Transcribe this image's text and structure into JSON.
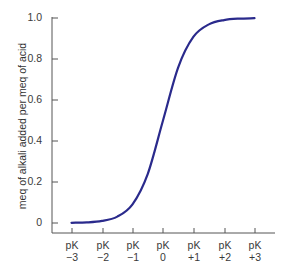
{
  "chart_data": {
    "type": "line",
    "title": "",
    "xlabel": "",
    "ylabel": "meq of alkali added per meq of acid",
    "ylim": [
      0,
      1.0
    ],
    "xlim": [
      -3,
      3
    ],
    "grid": false,
    "legend": null,
    "x_tick_labels": [
      {
        "top": "pK",
        "bottom": "−3"
      },
      {
        "top": "pK",
        "bottom": "−2"
      },
      {
        "top": "pK",
        "bottom": "−1"
      },
      {
        "top": "pK",
        "bottom": "0"
      },
      {
        "top": "pK",
        "bottom": "+1"
      },
      {
        "top": "pK",
        "bottom": "+2"
      },
      {
        "top": "pK",
        "bottom": "+3"
      }
    ],
    "y_tick_labels": [
      "0",
      "0.2",
      "0.4",
      "0.6",
      "0.8",
      "1.0"
    ],
    "series": [
      {
        "name": "titration curve",
        "color": "#2a2a8c",
        "x": [
          -3,
          -2.5,
          -2,
          -1.5,
          -1,
          -0.5,
          0,
          0.5,
          1,
          1.5,
          2,
          2.5,
          3
        ],
        "values": [
          0.001,
          0.003,
          0.01,
          0.031,
          0.091,
          0.24,
          0.5,
          0.76,
          0.909,
          0.969,
          0.99,
          0.997,
          0.999
        ]
      }
    ]
  },
  "labels": {
    "ylabel": "meq of alkali added per meq of acid",
    "yticks": [
      "0",
      "0.2",
      "0.4",
      "0.6",
      "0.8",
      "1.0"
    ],
    "xticks_top": [
      "pK",
      "pK",
      "pK",
      "pK",
      "pK",
      "pK",
      "pK"
    ],
    "xticks_bottom": [
      "−3",
      "−2",
      "−1",
      "0",
      "+1",
      "+2",
      "+3"
    ]
  }
}
